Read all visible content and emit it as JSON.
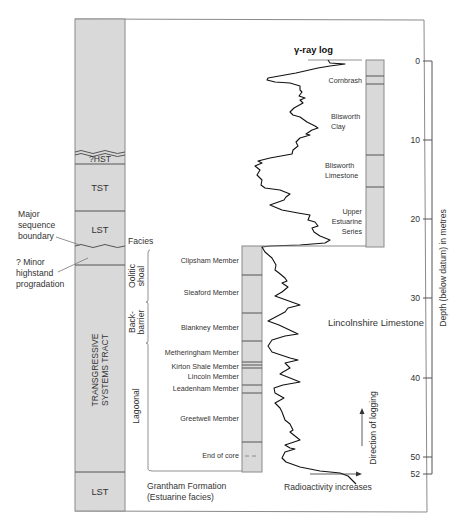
{
  "diagram": {
    "title": "γ-ray log",
    "colors": {
      "column_fill": "#d9d9d9",
      "column_stroke": "#8a8a8a",
      "curve": "#111111",
      "text": "#333333"
    },
    "systems_tracts": {
      "items": [
        {
          "label": "?HST",
          "top_y": 152,
          "bottom_y": 164
        },
        {
          "label": "TST",
          "top_y": 164,
          "bottom_y": 211
        },
        {
          "label": "LST",
          "top_y": 211,
          "bottom_y": 247
        },
        {
          "label": "TRANSGRESSIVE",
          "label2": "SYSTEMS TRACT",
          "top_y": 265,
          "bottom_y": 472
        },
        {
          "label": "LST",
          "top_y": 472,
          "bottom_y": 511
        }
      ]
    },
    "annotations": {
      "major_boundary": [
        "Major",
        "sequence",
        "boundary"
      ],
      "minor_highstand": [
        "? Minor",
        "highstand",
        "progradation"
      ],
      "facies_header": "Facies"
    },
    "facies": [
      {
        "label1": "Oolitic",
        "label2": "shoal",
        "top_y": 250,
        "bottom_y": 302
      },
      {
        "label1": "Back-",
        "label2": "barrier",
        "top_y": 302,
        "bottom_y": 343
      },
      {
        "label1": "Lagoonal",
        "label2": "",
        "top_y": 343,
        "bottom_y": 471
      }
    ],
    "lower_members": [
      {
        "label": "Clipsham Member"
      },
      {
        "label": "Sleaford Member"
      },
      {
        "label": "Blankney Member"
      },
      {
        "label": "Metheringham Member"
      },
      {
        "label": "Kirton Shale Member"
      },
      {
        "label": "Lincoln Member"
      },
      {
        "label": "Leadenham Member"
      },
      {
        "label": "Greetwell Member"
      },
      {
        "label": "End of core"
      }
    ],
    "upper_units": [
      {
        "label": [
          "Cornbrash"
        ]
      },
      {
        "label": [
          "Blisworth",
          "Clay"
        ]
      },
      {
        "label": [
          "Blisworth",
          "Limestone"
        ]
      },
      {
        "label": [
          "Upper",
          "Estuarine",
          "Series"
        ]
      }
    ],
    "formation_labels": {
      "lincolnshire": "Lincolnshire Limestone",
      "grantham_1": "Grantham Formation",
      "grantham_2": "(Estuarine facies)",
      "radioactivity": "Radioactivity increases",
      "direction": "Direction of logging"
    },
    "depth_axis": {
      "label": "Depth (below datum) in metres",
      "ticks": [
        "0",
        "10",
        "20",
        "30",
        "40",
        "50",
        "52"
      ],
      "units": "m"
    }
  }
}
